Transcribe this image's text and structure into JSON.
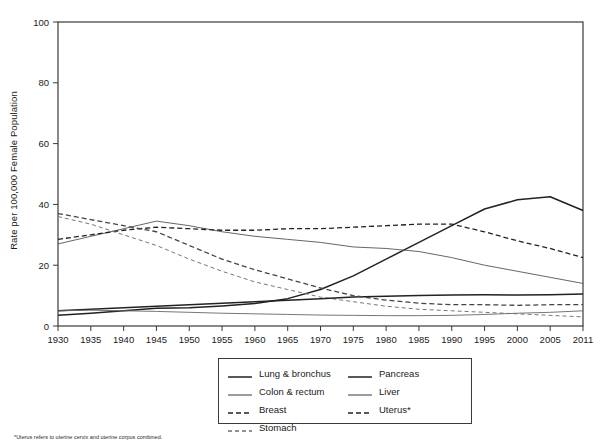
{
  "chart_data": {
    "type": "line",
    "title": "",
    "xlabel": "",
    "ylabel": "Rate per 100,000 Female Population",
    "xlim": [
      1930,
      2011
    ],
    "ylim": [
      0,
      100
    ],
    "grid": false,
    "legend_position": "bottom-center",
    "y_ticks": [
      "0",
      "20",
      "40",
      "60",
      "80",
      "100"
    ],
    "y_tick_values": [
      0,
      20,
      40,
      60,
      80,
      100
    ],
    "x_ticks": [
      "1930",
      "1935",
      "1940",
      "1945",
      "1950",
      "1955",
      "1960",
      "1965",
      "1970",
      "1975",
      "1980",
      "1985",
      "1990",
      "1995",
      "2000",
      "2005",
      "2011"
    ],
    "x_tick_values": [
      1930,
      1935,
      1940,
      1945,
      1950,
      1955,
      1960,
      1965,
      1970,
      1975,
      1980,
      1985,
      1990,
      1995,
      2000,
      2005,
      2011
    ],
    "x": [
      1930,
      1935,
      1940,
      1945,
      1950,
      1955,
      1960,
      1965,
      1970,
      1975,
      1980,
      1985,
      1990,
      1995,
      2000,
      2005,
      2011
    ],
    "series": [
      {
        "name": "Lung & bronchus",
        "style": "solid-thick",
        "color": "#222222",
        "values": [
          3.5,
          4.2,
          5.0,
          5.8,
          6.0,
          6.6,
          7.4,
          9.0,
          12.0,
          16.5,
          22.0,
          27.5,
          33.0,
          38.5,
          41.5,
          42.5,
          38.0
        ]
      },
      {
        "name": "Colon & rectum",
        "style": "solid-thin",
        "color": "#555555",
        "values": [
          27.0,
          29.5,
          32.0,
          34.5,
          33.0,
          31.0,
          29.5,
          28.5,
          27.5,
          26.0,
          25.5,
          24.5,
          22.5,
          20.0,
          18.0,
          16.0,
          14.0
        ]
      },
      {
        "name": "Breast",
        "style": "dashed",
        "color": "#222222",
        "values": [
          28.5,
          30.0,
          31.5,
          32.5,
          32.0,
          31.5,
          31.5,
          32.0,
          32.0,
          32.5,
          33.0,
          33.5,
          33.5,
          31.0,
          28.0,
          25.5,
          22.5
        ]
      },
      {
        "name": "Stomach",
        "style": "dashed-fine",
        "color": "#777777",
        "values": [
          36.0,
          33.5,
          30.0,
          26.5,
          22.0,
          18.0,
          14.5,
          12.0,
          9.5,
          8.0,
          6.5,
          5.5,
          5.0,
          4.5,
          4.0,
          3.5,
          3.0
        ]
      },
      {
        "name": "Pancreas",
        "style": "solid-thick",
        "color": "#222222",
        "values": [
          5.0,
          5.5,
          6.0,
          6.5,
          7.0,
          7.5,
          8.0,
          8.5,
          9.0,
          9.5,
          9.8,
          10.0,
          10.2,
          10.3,
          10.2,
          10.3,
          10.5
        ]
      },
      {
        "name": "Liver",
        "style": "solid-thin",
        "color": "#666666",
        "values": [
          5.0,
          5.2,
          5.0,
          4.8,
          4.5,
          4.2,
          4.0,
          3.8,
          3.6,
          3.5,
          3.4,
          3.4,
          3.5,
          3.8,
          4.2,
          4.5,
          5.0
        ]
      },
      {
        "name": "Uterus*",
        "style": "dashed",
        "color": "#444444",
        "values": [
          37.0,
          35.0,
          33.0,
          31.0,
          26.5,
          22.0,
          18.5,
          15.5,
          12.5,
          10.0,
          8.5,
          7.5,
          7.0,
          7.0,
          6.8,
          7.0,
          7.0
        ]
      }
    ],
    "legend": [
      {
        "label": "Lung & bronchus",
        "style": "solid-thick"
      },
      {
        "label": "Pancreas",
        "style": "solid-thick"
      },
      {
        "label": "Colon & rectum",
        "style": "solid-thin"
      },
      {
        "label": "Liver",
        "style": "solid-thin"
      },
      {
        "label": "Breast",
        "style": "dashed"
      },
      {
        "label": "Uterus*",
        "style": "dashed"
      },
      {
        "label": "Stomach",
        "style": "dashed-fine"
      }
    ],
    "legend_left_column": [
      "Lung & bronchus",
      "Colon & rectum",
      "Breast",
      "Stomach"
    ],
    "legend_right_column": [
      "Pancreas",
      "Liver",
      "Uterus*"
    ],
    "footnote": "*Uterus refers to uterine cervix and uterine corpus combined."
  }
}
